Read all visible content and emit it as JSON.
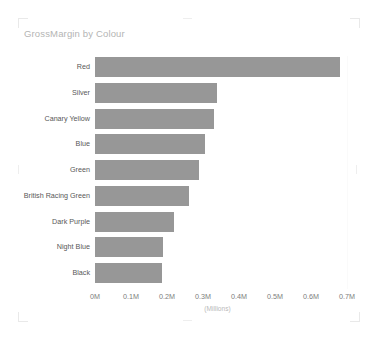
{
  "card": {
    "title": "GrossMargin by Colour",
    "background": "#ffffff"
  },
  "colors": {
    "bar": "#979797",
    "title_text": "#b4b4b4",
    "category_text": "#585858",
    "tick_text": "#7d7d7d",
    "axis_title_text": "#b9b9b9",
    "gridline": "#fafafa"
  },
  "chart_data": {
    "type": "bar",
    "orientation": "horizontal",
    "title": "GrossMargin by Colour",
    "xlabel": "(Millions)",
    "ylabel": "",
    "categories": [
      "Red",
      "Silver",
      "Canary Yellow",
      "Blue",
      "Green",
      "British Racing Green",
      "Dark Purple",
      "Night Blue",
      "Black"
    ],
    "values": [
      0.68,
      0.34,
      0.33,
      0.305,
      0.29,
      0.26,
      0.22,
      0.19,
      0.185
    ],
    "value_unit": "Millions",
    "series": [
      {
        "name": "GrossMargin",
        "values": [
          0.68,
          0.34,
          0.33,
          0.305,
          0.29,
          0.26,
          0.22,
          0.19,
          0.185
        ]
      }
    ],
    "xlim": [
      0,
      0.7
    ],
    "xticks": [
      0,
      0.1,
      0.2,
      0.3,
      0.4,
      0.5,
      0.6,
      0.7
    ],
    "xtick_labels": [
      "0M",
      "0.1M",
      "0.2M",
      "0.3M",
      "0.4M",
      "0.5M",
      "0.6M",
      "0.7M"
    ],
    "grid": false,
    "legend": false,
    "sorted": "descending"
  }
}
